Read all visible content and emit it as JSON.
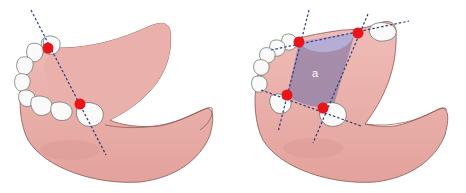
{
  "figure": {
    "panels": [
      {
        "id": "left",
        "description": "Mandible with two abutment teeth marked on one side, single dashed axis line through both",
        "abutment_points": 2,
        "axis_lines": 1
      },
      {
        "id": "right",
        "description": "Mandible with four abutment teeth marked, dashed lines forming a quadrilateral support area",
        "abutment_points": 4,
        "axis_lines": 4,
        "region_label": "a"
      }
    ]
  },
  "colors": {
    "gum": "#e8aaa5",
    "gum_dark": "#c98884",
    "gum_outline": "#8a5550",
    "tooth": "#fafafa",
    "tooth_outline": "#5d6a60",
    "marker": "#e8141a",
    "axis_line": "#2c3e78",
    "region_fill": "#8c7fa8"
  }
}
